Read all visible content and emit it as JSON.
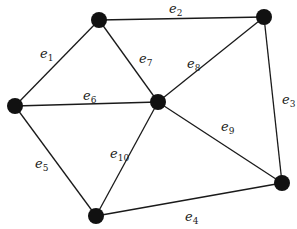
{
  "diagram": {
    "type": "graph",
    "directed": false,
    "colors": {
      "edge": "#1a1a1a",
      "node": "#111111",
      "label": "#222222",
      "background": "#ffffff"
    },
    "nodes": [
      {
        "id": "v1",
        "x": 99,
        "y": 20
      },
      {
        "id": "v2",
        "x": 264,
        "y": 17
      },
      {
        "id": "v3",
        "x": 15,
        "y": 106
      },
      {
        "id": "v4",
        "x": 158,
        "y": 102
      },
      {
        "id": "v5",
        "x": 96,
        "y": 216
      },
      {
        "id": "v6",
        "x": 282,
        "y": 183
      }
    ],
    "edges": [
      {
        "id": "e1",
        "from": "v1",
        "to": "v3",
        "label": "e",
        "sub": "1",
        "lx": 40,
        "ly": 58
      },
      {
        "id": "e2",
        "from": "v1",
        "to": "v2",
        "label": "e",
        "sub": "2",
        "lx": 169,
        "ly": 13
      },
      {
        "id": "e3",
        "from": "v2",
        "to": "v6",
        "label": "e",
        "sub": "3",
        "lx": 282,
        "ly": 104
      },
      {
        "id": "e4",
        "from": "v5",
        "to": "v6",
        "label": "e",
        "sub": "4",
        "lx": 185,
        "ly": 221
      },
      {
        "id": "e5",
        "from": "v3",
        "to": "v5",
        "label": "e",
        "sub": "5",
        "lx": 35,
        "ly": 168
      },
      {
        "id": "e6",
        "from": "v3",
        "to": "v4",
        "label": "e",
        "sub": "6",
        "lx": 83,
        "ly": 100
      },
      {
        "id": "e7",
        "from": "v1",
        "to": "v4",
        "label": "e",
        "sub": "7",
        "lx": 139,
        "ly": 63
      },
      {
        "id": "e8",
        "from": "v2",
        "to": "v4",
        "label": "e",
        "sub": "8",
        "lx": 187,
        "ly": 68
      },
      {
        "id": "e9",
        "from": "v4",
        "to": "v6",
        "label": "e",
        "sub": "9",
        "lx": 221,
        "ly": 131
      },
      {
        "id": "e10",
        "from": "v4",
        "to": "v5",
        "label": "e",
        "sub": "10",
        "lx": 110,
        "ly": 158
      }
    ]
  }
}
